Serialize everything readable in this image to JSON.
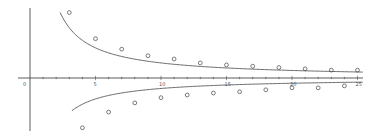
{
  "chart_data": {
    "type": "scatter",
    "title": "",
    "xlabel": "",
    "ylabel": "",
    "xlim": [
      0,
      25
    ],
    "ylim": [
      -4.6,
      5.7
    ],
    "grid": false,
    "legend": null,
    "x_ticks": [
      "0",
      "5",
      "10",
      "15",
      "20",
      "25"
    ],
    "series": [
      {
        "name": "upper points",
        "marker": "circle-open",
        "x": [
          3,
          5,
          7,
          9,
          11,
          13,
          15,
          17,
          19,
          21,
          23,
          25
        ],
        "y": [
          5.0,
          3.0,
          2.2,
          1.7,
          1.45,
          1.15,
          1.0,
          0.9,
          0.8,
          0.7,
          0.6,
          0.6
        ]
      },
      {
        "name": "lower points",
        "marker": "circle-open",
        "x": [
          4,
          6,
          8,
          10,
          12,
          14,
          16,
          18,
          20,
          22,
          24
        ],
        "y": [
          -3.8,
          -2.6,
          -1.9,
          -1.5,
          -1.3,
          -1.15,
          -1.05,
          -0.9,
          -0.75,
          -0.75,
          -0.6
        ]
      },
      {
        "name": "upper curve",
        "type": "line",
        "formula": "y ≈ 11.5/x",
        "x_range": [
          2.3,
          25.5
        ]
      },
      {
        "name": "lower curve",
        "type": "line",
        "formula": "y ≈ -8/x",
        "x_range": [
          3.2,
          25.5
        ]
      }
    ]
  },
  "axis": {
    "origin_label": "0",
    "tick_labels": [
      {
        "value": 0,
        "label": "0"
      },
      {
        "value": 5,
        "label": "5"
      },
      {
        "value": 10,
        "label": "10"
      },
      {
        "value": 15,
        "label": "15"
      },
      {
        "value": 20,
        "label": "20"
      },
      {
        "value": 25,
        "label": "25"
      }
    ]
  }
}
